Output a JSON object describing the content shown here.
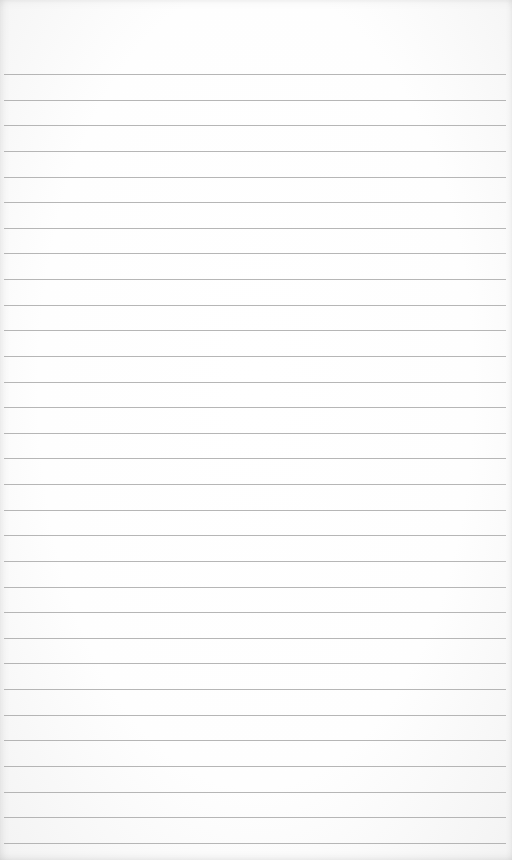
{
  "paper": {
    "type": "lined-notepad-page",
    "background_color": "#ffffff",
    "line_color": "#a9a9a9",
    "first_line_y": 74,
    "line_spacing": 25.63,
    "line_count": 31,
    "text": ""
  }
}
